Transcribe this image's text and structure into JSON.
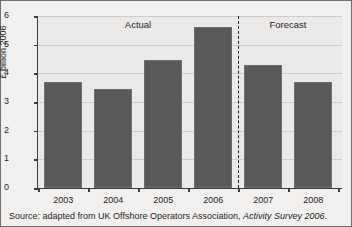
{
  "chart_data": {
    "type": "bar",
    "title": "",
    "xlabel": "",
    "ylabel": "£ billion 2006",
    "categories": [
      "2003",
      "2004",
      "2005",
      "2006",
      "2007",
      "2008"
    ],
    "values": [
      3.7,
      3.45,
      4.45,
      5.6,
      4.3,
      3.7
    ],
    "ylim": [
      0,
      6
    ],
    "yticks": [
      "0",
      "1",
      "2",
      "3",
      "4",
      "5",
      "6"
    ],
    "ytick_values": [
      0,
      1,
      2,
      3,
      4,
      5,
      6
    ],
    "grid": true,
    "legend": "none",
    "bar_color": "#58595b",
    "plot_background": "#eceae8",
    "annotations": [
      {
        "name": "actual",
        "text": "Actual",
        "region_categories": [
          "2003",
          "2004",
          "2005",
          "2006"
        ]
      },
      {
        "name": "forecast",
        "text": "Forecast",
        "region_categories": [
          "2007",
          "2008"
        ]
      },
      {
        "name": "divider",
        "text": "",
        "style": "dashed-vertical",
        "between": [
          "2006",
          "2007"
        ]
      }
    ]
  },
  "source": {
    "prefix": "Source: adapted from UK Offshore Operators Association, ",
    "title": "Activity Survey 2006",
    "suffix": "."
  }
}
